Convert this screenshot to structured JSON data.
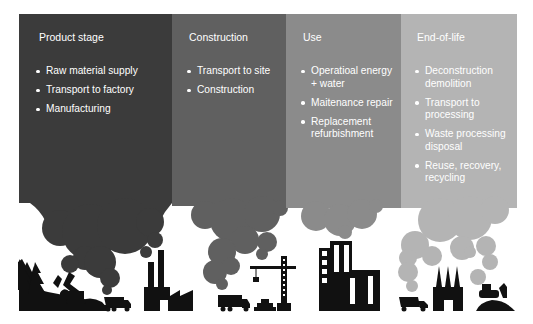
{
  "stages": [
    {
      "title": "Product stage",
      "color": "#3b3b3b",
      "items": [
        "Raw material supply",
        "Transport to factory",
        "Manufacturing"
      ]
    },
    {
      "title": "Construction",
      "color": "#606060",
      "items": [
        "Transport to site",
        "Construction"
      ]
    },
    {
      "title": "Use",
      "color": "#8b8b8b",
      "items": [
        "Operatioal energy + water",
        "Maitenance repair",
        "Replacement refurbishment"
      ]
    },
    {
      "title": "End-of-life",
      "color": "#b4b4b4",
      "items": [
        "Deconstruction demolition",
        "Transport to processing",
        "Waste processing disposal",
        "Reuse, recovery, recycling"
      ]
    }
  ],
  "icons": {
    "stage1": [
      "forest-icon",
      "excavator-icon",
      "dump-truck-icon",
      "factory-icon"
    ],
    "stage2": [
      "truck-icon",
      "bricks-icon",
      "tower-crane-icon"
    ],
    "stage3": [
      "office-building-icon"
    ],
    "stage4": [
      "truck-icon",
      "factory-icon",
      "bulldozer-icon"
    ]
  }
}
